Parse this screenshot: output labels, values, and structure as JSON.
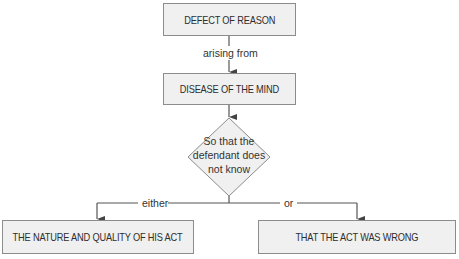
{
  "diagram": {
    "nodes": {
      "defect": "DEFECT OF REASON",
      "disease": "DISEASE OF THE MIND",
      "decision_line1": "So that the",
      "decision_line2": "defendant does",
      "decision_line3": "not know",
      "nature": "THE NATURE AND QUALITY OF HIS ACT",
      "wrong": "THAT THE ACT WAS WRONG"
    },
    "edges": {
      "arising": "arising from",
      "either": "either",
      "or": "or"
    },
    "colors": {
      "box_fill": "#f0f0f0",
      "box_border": "#8c8c8c",
      "line": "#555555",
      "text": "#333333"
    }
  }
}
